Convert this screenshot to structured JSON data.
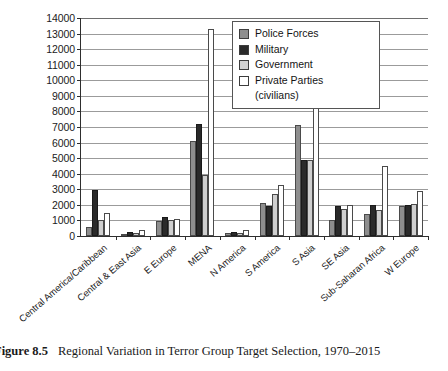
{
  "caption": {
    "label": "Figure 8.5",
    "text": "Regional Variation in Terror Group Target Selection, 1970–2015"
  },
  "legend": {
    "position": "top-right",
    "items": [
      {
        "label": "Police Forces",
        "color": "#8e8e8e"
      },
      {
        "label": "Military",
        "color": "#2a2a2a"
      },
      {
        "label": "Government",
        "color": "#d2d2d2"
      },
      {
        "label": "Private Parties",
        "sublabel": "(civilians)",
        "color": "#ffffff"
      }
    ]
  },
  "chart_data": {
    "type": "bar",
    "title": "Regional Variation in Terror Group Target Selection, 1970–2015",
    "xlabel": "",
    "ylabel": "",
    "ylim": [
      0,
      14000
    ],
    "ytick_step": 1000,
    "grid": true,
    "categories": [
      "Central America/Caribbean",
      "Central & East Asia",
      "E Europe",
      "MENA",
      "N America",
      "S America",
      "S Asia",
      "SE Asia",
      "Sub-Saharan Africa",
      "W Europe"
    ],
    "ytick_labels": [
      "0",
      "1000",
      "2000",
      "3000",
      "4000",
      "5000",
      "6000",
      "7000",
      "8000",
      "9000",
      "10000",
      "11000",
      "12000",
      "13000",
      "14000"
    ],
    "series": [
      {
        "name": "Police Forces",
        "color": "#8e8e8e",
        "values": [
          600,
          150,
          950,
          6100,
          200,
          2100,
          7100,
          1000,
          1400,
          1950
        ]
      },
      {
        "name": "Military",
        "color": "#2a2a2a",
        "values": [
          2950,
          250,
          1200,
          7200,
          250,
          1900,
          4900,
          1950,
          2000,
          2000
        ]
      },
      {
        "name": "Government",
        "color": "#d2d2d2",
        "values": [
          1050,
          200,
          1050,
          3900,
          200,
          2700,
          4900,
          1750,
          1650,
          2050
        ]
      },
      {
        "name": "Private Parties (civilians)",
        "color": "#ffffff",
        "values": [
          1450,
          400,
          1100,
          13300,
          400,
          3300,
          10200,
          2000,
          4500,
          2900
        ]
      }
    ]
  }
}
